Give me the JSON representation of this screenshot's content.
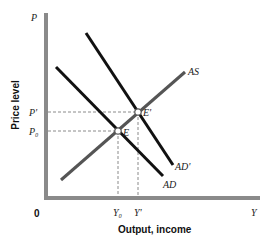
{
  "diagram": {
    "title": "",
    "y_axis": {
      "symbol": "P",
      "label": "Price level"
    },
    "x_axis": {
      "symbol": "Y",
      "label": "Output, income"
    },
    "origin_label": "0",
    "price_ticks": [
      {
        "label": "P'",
        "note": "new equilibrium price"
      },
      {
        "label": "P₀",
        "note": "initial equilibrium price"
      }
    ],
    "output_ticks": [
      {
        "label": "Y₀",
        "note": "initial equilibrium output"
      },
      {
        "label": "Y'",
        "note": "new equilibrium output"
      }
    ],
    "curves": [
      {
        "name": "AS",
        "label": "AS",
        "description": "Aggregate supply, upward sloping"
      },
      {
        "name": "AD",
        "label": "AD",
        "description": "Initial aggregate demand, downward sloping"
      },
      {
        "name": "AD'",
        "label": "AD'",
        "description": "Shifted aggregate demand (rightward)"
      }
    ],
    "points": [
      {
        "name": "E",
        "label": "E",
        "description": "Initial equilibrium (AD ∩ AS) at (Y₀, P₀)"
      },
      {
        "name": "E'",
        "label": "E'",
        "description": "New equilibrium (AD' ∩ AS) at (Y', P')"
      }
    ],
    "colors": {
      "axis": "#8a8a8a",
      "ad_curves": "#111111",
      "as_curve": "#555555",
      "dashed": "#8a8a8a"
    }
  }
}
